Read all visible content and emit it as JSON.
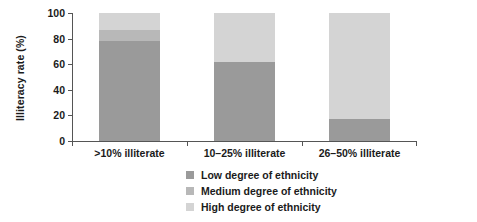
{
  "chart_data": {
    "type": "bar",
    "subtype": "stacked-bar-100",
    "title": "",
    "xlabel": "",
    "ylabel": "Illiteracy rate (%)",
    "ylim": [
      0,
      100
    ],
    "yticks": [
      0,
      20,
      40,
      60,
      80,
      100
    ],
    "ytick_labels": [
      "0",
      "20",
      "40",
      "60",
      "80",
      "100"
    ],
    "grid": false,
    "legend_position": "bottom-center",
    "categories": [
      ">10% illiterate",
      "10–25% illiterate",
      "26–50% illiterate"
    ],
    "series": [
      {
        "name": "Low degree of ethnicity",
        "color": "#9a9a9a",
        "values": [
          78,
          62,
          17
        ]
      },
      {
        "name": "Medium degree of ethnicity",
        "color": "#b8b8b8",
        "values": [
          9,
          0,
          0
        ]
      },
      {
        "name": "High degree of ethnicity",
        "color": "#d4d4d4",
        "values": [
          13,
          38,
          83
        ]
      }
    ]
  },
  "axis": {
    "line_color": "#555555",
    "tick_color": "#555555"
  },
  "legend": {
    "items": [
      {
        "label": "Low degree of ethnicity",
        "color": "#9a9a9a"
      },
      {
        "label": "Medium degree of ethnicity",
        "color": "#b8b8b8"
      },
      {
        "label": "High degree of ethnicity",
        "color": "#d4d4d4"
      }
    ]
  }
}
